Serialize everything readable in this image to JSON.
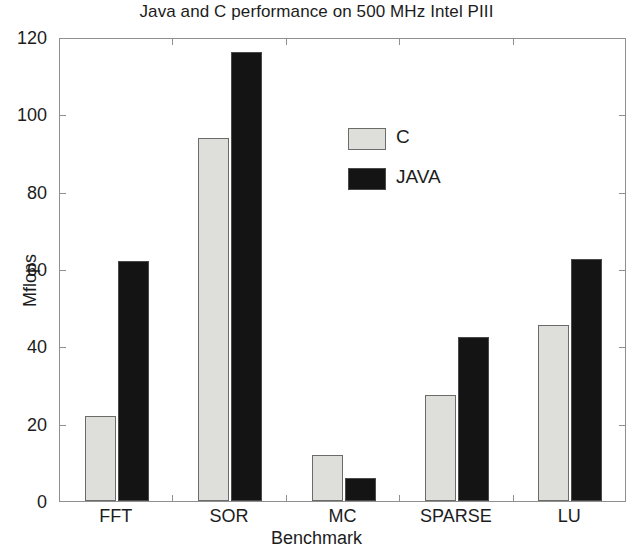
{
  "chart_data": {
    "type": "bar",
    "title": "Java and C performance on 500 MHz Intel PIII",
    "xlabel": "Benchmark",
    "ylabel": "Mflops",
    "categories": [
      "FFT",
      "SOR",
      "MC",
      "SPARSE",
      "LU"
    ],
    "series": [
      {
        "name": "C",
        "color": "#dededa",
        "values": [
          22,
          94,
          12,
          27.5,
          45.5
        ]
      },
      {
        "name": "JAVA",
        "color": "#141414",
        "values": [
          62,
          116,
          6,
          42.5,
          62.5
        ]
      }
    ],
    "ylim": [
      0,
      120
    ],
    "yticks": [
      0,
      20,
      40,
      60,
      80,
      100,
      120
    ],
    "ytick_labels": [
      "0",
      "20",
      "40",
      "60",
      "80",
      "100",
      "120"
    ],
    "grid": false,
    "legend_position": "upper center",
    "legend_entries": [
      "C",
      "JAVA"
    ]
  }
}
